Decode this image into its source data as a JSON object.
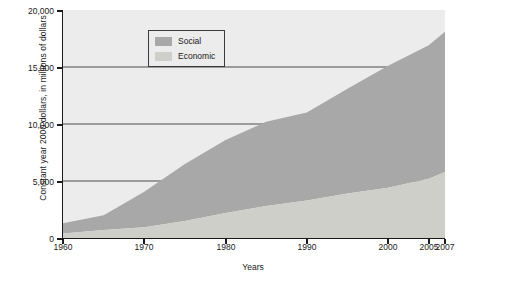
{
  "chart_data": {
    "type": "area",
    "title": "",
    "xlabel": "Years",
    "ylabel": "Constant year 2000 dollars, in millions of dollars",
    "x": [
      1960,
      1965,
      1970,
      1975,
      1980,
      1985,
      1990,
      1995,
      2000,
      2005,
      2007
    ],
    "xlim": [
      1960,
      2007
    ],
    "ylim": [
      0,
      20000
    ],
    "yticks": [
      0,
      5000,
      10000,
      15000,
      20000
    ],
    "ytick_labels": [
      "0",
      "5,000",
      "10,000",
      "15,000",
      "20,000"
    ],
    "xticks": [
      1960,
      1970,
      1980,
      1990,
      2000,
      2005,
      2007
    ],
    "xtick_labels": [
      "1960",
      "1970",
      "1980",
      "1990",
      "2000",
      "2005",
      "2007"
    ],
    "grid": true,
    "stacked": true,
    "legend_position": "top-left",
    "series": [
      {
        "name": "Economic",
        "color": "#cfcfc9",
        "values": [
          400,
          700,
          950,
          1500,
          2200,
          2800,
          3300,
          3900,
          4400,
          5200,
          5800
        ]
      },
      {
        "name": "Social",
        "color": "#a8a8a8",
        "values": [
          900,
          1300,
          3100,
          5000,
          6400,
          7400,
          7700,
          9200,
          10700,
          11700,
          12300
        ]
      }
    ],
    "totals": [
      1300,
      2000,
      4050,
      6500,
      8600,
      10200,
      11000,
      13100,
      15100,
      16900,
      18100
    ],
    "plot_background": "#ececed",
    "axis_color": "#1a1a1a",
    "gridline_color": "#4a4a4a"
  },
  "legend": {
    "items": [
      {
        "label": "Social",
        "color": "#a8a8a8"
      },
      {
        "label": "Economic",
        "color": "#cfcfc9"
      }
    ]
  },
  "axes": {
    "y_title": "Constant year 2000 dollars, in millions of dollars",
    "x_title": "Years"
  }
}
